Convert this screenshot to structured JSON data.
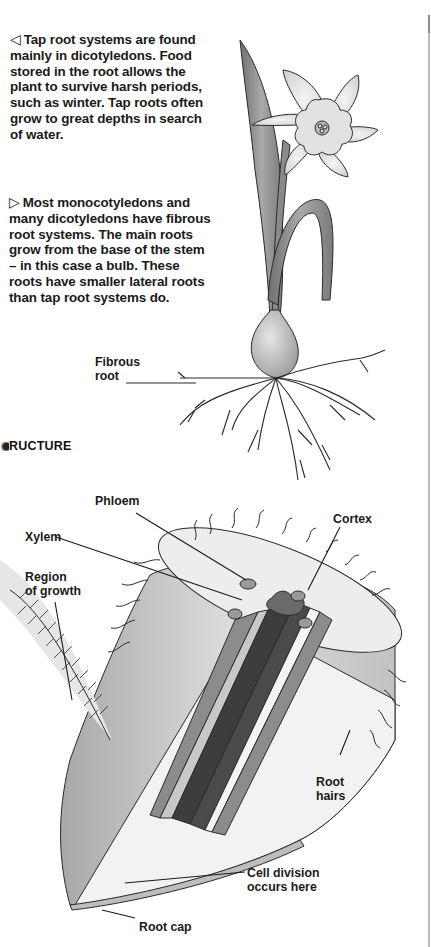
{
  "page": {
    "captions": {
      "tap_root": {
        "marker": "◁",
        "text": "Tap root systems are found mainly in dicotyledons. Food stored in the root allows the plant to survive harsh periods, such as winter. Tap roots often grow to great depths in search of water.",
        "lines": [
          "Tap root systems are found",
          "mainly in dicotyledons. Food",
          "stored in the root allows the",
          "plant to survive harsh periods,",
          "such as winter. Tap roots often",
          "grow to great depths in search",
          "of water."
        ]
      },
      "fibrous_root": {
        "marker": "▷",
        "text": "Most monocotyledons and many dicotyledons have fibrous root systems. The main roots grow from the base of the stem – in this case a bulb. These roots have smaller lateral roots than tap root systems do.",
        "lines": [
          "Most monocotyledons and",
          "many dicotyledons have fibrous",
          "root systems. The main roots",
          "grow from the base of the stem",
          "– in this case a bulb. These",
          "roots have smaller lateral roots",
          "than tap root systems do."
        ]
      }
    },
    "plant_illustration": {
      "subject": "daffodil with bulb and fibrous roots",
      "labels": {
        "fibrous_root_line1": "Fibrous",
        "fibrous_root_line2": "root"
      }
    },
    "section_heading": "RUCTURE",
    "root_diagram": {
      "subject": "cutaway of root tip",
      "labels": {
        "phloem": "Phloem",
        "cortex": "Cortex",
        "xylem": "Xylem",
        "region_of_growth_line1": "Region",
        "region_of_growth_line2": "of growth",
        "root_hairs_line1": "Root",
        "root_hairs_line2": "hairs",
        "cell_division_line1": "Cell division",
        "cell_division_line2": "occurs here",
        "root_cap": "Root cap"
      }
    },
    "colors": {
      "text": "#1a1a1a",
      "outline": "#2a2a2a",
      "xylem": "#3d3d3d",
      "phloem": "#8c8c8c",
      "cortex": "#ececec",
      "stele_light": "#b5b5b5",
      "leaf": "#8e8e8e"
    }
  }
}
